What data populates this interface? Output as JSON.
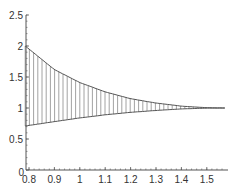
{
  "chart_data": {
    "type": "area",
    "title": "",
    "xlabel": "",
    "ylabel": "",
    "xlim": [
      0.785,
      1.5708
    ],
    "ylim": [
      0,
      2.5
    ],
    "grid": false,
    "x_ticks": [
      "0.8",
      "0.9",
      "1",
      "1.1",
      "1.2",
      "1.3",
      "1.4",
      "1.5"
    ],
    "y_ticks": [
      "0",
      "0.5",
      "1",
      "1.5",
      "2",
      "2.5"
    ],
    "series": [
      {
        "name": "upper",
        "description": "upper boundary curve (≈ 1/sin²x)",
        "x": [
          0.785,
          0.9,
          1.0,
          1.1,
          1.2,
          1.3,
          1.4,
          1.5,
          1.571
        ],
        "values": [
          2.0,
          1.62,
          1.41,
          1.26,
          1.15,
          1.08,
          1.03,
          1.005,
          1.0
        ]
      },
      {
        "name": "lower",
        "description": "lower boundary curve (≈ sin x)",
        "x": [
          0.785,
          0.9,
          1.0,
          1.1,
          1.2,
          1.3,
          1.4,
          1.5,
          1.571
        ],
        "values": [
          0.71,
          0.78,
          0.84,
          0.89,
          0.93,
          0.96,
          0.985,
          0.998,
          1.0
        ]
      }
    ],
    "fill": "vertical hatch lines between upper and lower curves",
    "colors": {
      "curve": "#555555",
      "hatch": "#8a8a8a",
      "axis": "#555555",
      "text": "#333333"
    }
  }
}
